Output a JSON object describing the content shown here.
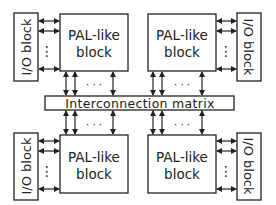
{
  "diagram": {
    "title": "",
    "pal_blocks": [
      {
        "id": "pal-top-left",
        "label_line1": "PAL-like",
        "label_line2": "block"
      },
      {
        "id": "pal-top-right",
        "label_line1": "PAL-like",
        "label_line2": "block"
      },
      {
        "id": "pal-bottom-left",
        "label_line1": "PAL-like",
        "label_line2": "block"
      },
      {
        "id": "pal-bottom-right",
        "label_line1": "PAL-like",
        "label_line2": "block"
      }
    ],
    "io_blocks": [
      {
        "id": "io-top-left",
        "label": "I/O block"
      },
      {
        "id": "io-top-right",
        "label": "I/O block"
      },
      {
        "id": "io-bottom-left",
        "label": "I/O block"
      },
      {
        "id": "io-bottom-right",
        "label": "I/O block"
      }
    ],
    "interconnect": {
      "label": "Interconnection matrix"
    },
    "ellipsis_h": "· · ·",
    "ellipsis_v": "⋮",
    "colors": {
      "stroke": "#222222",
      "background": "#ffffff"
    }
  }
}
